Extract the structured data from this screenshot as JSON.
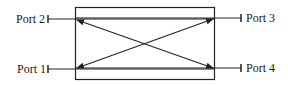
{
  "diagram": {
    "type": "four-port-coupler",
    "ports": [
      {
        "id": 1,
        "label": "Port 1",
        "side": "left",
        "position": "bottom"
      },
      {
        "id": 2,
        "label": "Port 2",
        "side": "left",
        "position": "top"
      },
      {
        "id": 3,
        "label": "Port 3",
        "side": "right",
        "position": "top"
      },
      {
        "id": 4,
        "label": "Port 4",
        "side": "right",
        "position": "bottom"
      }
    ],
    "connections": [
      {
        "from": "Port 1",
        "to": "Port 3",
        "bidirectional": true
      },
      {
        "from": "Port 2",
        "to": "Port 4",
        "bidirectional": true
      }
    ],
    "colors": {
      "stroke": "#222222",
      "background": "#ffffff"
    }
  }
}
